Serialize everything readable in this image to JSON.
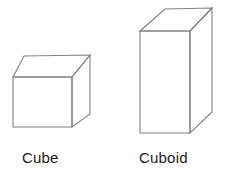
{
  "page": {
    "background_color": "#ffffff",
    "width": 229,
    "height": 173
  },
  "style": {
    "stroke_color": "#808080",
    "fill_color": "#ffffff",
    "text_color": "#1a1a1a"
  },
  "figures": [
    {
      "id": "cube",
      "label": "Cube",
      "shape": "cube",
      "front_face": "M13,77 L72,77 L72,127 L13,127 Z",
      "top_face": "M13,77 L24,56 L90,55 L72,77 Z",
      "right_face": "M72,77 L90,55 L90,114 L72,127 Z"
    },
    {
      "id": "cuboid",
      "label": "Cuboid",
      "shape": "cuboid",
      "front_face": "M140,31 L190,31 L190,133 L140,133 Z",
      "top_face": "M140,31 L165,9 L212,8 L190,31 Z",
      "right_face": "M190,31 L212,8 L212,112 L190,133 Z"
    }
  ],
  "captions": {
    "cube": "Cube",
    "cuboid": "Cuboid"
  }
}
